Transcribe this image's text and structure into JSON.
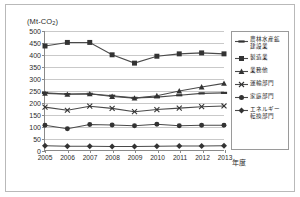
{
  "unit_label": "(Mt-CO",
  "unit_sub": "2",
  "unit_label_end": ")",
  "x_axis_title": "年度",
  "colors": {
    "series_line": "#4a4a4a",
    "marker": "#333333",
    "gridline": "#c9c9c9",
    "axis": "#8a8a8a",
    "frame": "#b9b9b9"
  },
  "chart_data": {
    "type": "line",
    "title": "",
    "subtitle": "",
    "xlabel": "年度",
    "ylabel": "(Mt-CO2)",
    "ylim": [
      0,
      500
    ],
    "ytick_step": 50,
    "yticks": [
      0,
      50,
      100,
      150,
      200,
      250,
      300,
      350,
      400,
      450,
      500
    ],
    "ytick_labels": [
      "0",
      "50",
      "100",
      "150",
      "200",
      "250",
      "300",
      "350",
      "400",
      "450",
      "500"
    ],
    "grid": true,
    "grid_axis": "y",
    "legend_position": "right",
    "categories": [
      2005,
      2006,
      2007,
      2008,
      2009,
      2010,
      2011,
      2012,
      2013
    ],
    "xtick_labels": [
      "2005",
      "2006",
      "2007",
      "2008",
      "2009",
      "2010",
      "2011",
      "2012",
      "2013"
    ],
    "series": [
      {
        "name": "農林水産鉱\n建設業",
        "marker": "dash",
        "values": [
          240,
          235,
          236,
          228,
          219,
          222,
          230,
          238,
          240
        ]
      },
      {
        "name": "製造業",
        "marker": "square",
        "values": [
          437,
          452,
          452,
          400,
          365,
          394,
          404,
          408,
          404
        ]
      },
      {
        "name": "業務他",
        "marker": "triangle",
        "values": [
          238,
          234,
          236,
          225,
          218,
          228,
          248,
          265,
          280
        ]
      },
      {
        "name": "運輸部門",
        "marker": "cross",
        "values": [
          180,
          167,
          184,
          175,
          161,
          170,
          176,
          182,
          185
        ]
      },
      {
        "name": "家庭部門",
        "marker": "circle",
        "values": [
          104,
          89,
          107,
          105,
          102,
          108,
          102,
          104,
          104
        ]
      },
      {
        "name": "エネルギー\n転換部門",
        "marker": "diamond",
        "values": [
          18,
          16,
          16,
          15,
          15,
          16,
          17,
          17,
          18
        ]
      }
    ]
  }
}
